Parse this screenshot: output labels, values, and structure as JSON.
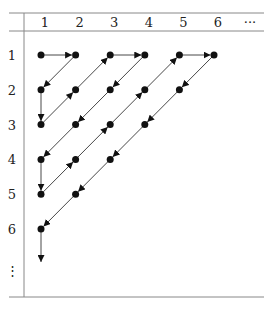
{
  "columns": [
    "1",
    "2",
    "3",
    "4",
    "5",
    "6",
    "···"
  ],
  "rows": [
    "1",
    "2",
    "3",
    "4",
    "5",
    "6",
    "⋮"
  ],
  "colors": {
    "line": "#333333",
    "dot": "#111111",
    "rule": "#888888"
  },
  "path": [
    [
      1,
      1
    ],
    [
      1,
      2
    ],
    [
      2,
      1
    ],
    [
      3,
      1
    ],
    [
      2,
      2
    ],
    [
      1,
      3
    ],
    [
      1,
      4
    ],
    [
      2,
      3
    ],
    [
      3,
      2
    ],
    [
      4,
      1
    ],
    [
      5,
      1
    ],
    [
      4,
      2
    ],
    [
      3,
      3
    ],
    [
      2,
      4
    ],
    [
      1,
      5
    ],
    [
      1,
      6
    ],
    [
      2,
      5
    ],
    [
      3,
      4
    ],
    [
      4,
      3
    ],
    [
      5,
      2
    ],
    [
      6,
      1
    ]
  ]
}
